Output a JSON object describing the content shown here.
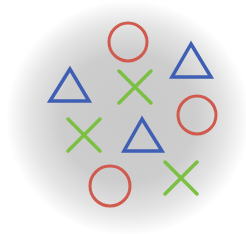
{
  "colors": {
    "circle": "#d05a4e",
    "triangle": "#3f5fb4",
    "cross": "#7bc043",
    "background_center": "#c9c9c9",
    "background_edge": "#ffffff"
  },
  "shapes": [
    {
      "type": "circle",
      "cx": 128,
      "cy": 42,
      "r": 19
    },
    {
      "type": "triangle",
      "points": "191,44 172,77 211,77"
    },
    {
      "type": "triangle",
      "points": "70,69 50,101 89,101"
    },
    {
      "type": "cross",
      "cx": 135,
      "cy": 87,
      "size": 16
    },
    {
      "type": "circle",
      "cx": 197,
      "cy": 115,
      "r": 19
    },
    {
      "type": "cross",
      "cx": 84,
      "cy": 135,
      "size": 16
    },
    {
      "type": "triangle",
      "points": "142,119 124,151 162,151"
    },
    {
      "type": "circle",
      "cx": 110,
      "cy": 186,
      "r": 20
    },
    {
      "type": "cross",
      "cx": 181,
      "cy": 178,
      "size": 16
    }
  ]
}
